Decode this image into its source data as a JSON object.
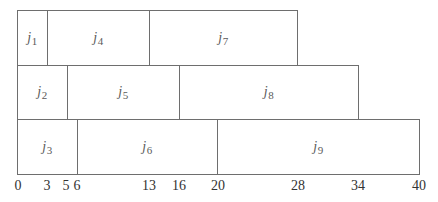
{
  "diagram": {
    "type": "gantt-schedule",
    "axis": {
      "min": 0,
      "max": 40,
      "ticks": [
        0,
        3,
        5,
        6,
        13,
        16,
        20,
        28,
        34,
        40
      ],
      "tick_labels": [
        "0",
        "3",
        "5",
        "6",
        "13",
        "16",
        "20",
        "28",
        "34",
        "40"
      ]
    },
    "rows": [
      {
        "jobs": [
          {
            "name": "j",
            "sub": "1",
            "start": 0,
            "end": 3
          },
          {
            "name": "j",
            "sub": "4",
            "start": 3,
            "end": 13
          },
          {
            "name": "j",
            "sub": "7",
            "start": 13,
            "end": 28
          }
        ]
      },
      {
        "jobs": [
          {
            "name": "j",
            "sub": "2",
            "start": 0,
            "end": 5
          },
          {
            "name": "j",
            "sub": "5",
            "start": 5,
            "end": 16
          },
          {
            "name": "j",
            "sub": "8",
            "start": 16,
            "end": 34
          }
        ]
      },
      {
        "jobs": [
          {
            "name": "j",
            "sub": "3",
            "start": 0,
            "end": 6
          },
          {
            "name": "j",
            "sub": "6",
            "start": 6,
            "end": 20
          },
          {
            "name": "j",
            "sub": "9",
            "start": 20,
            "end": 40
          }
        ]
      }
    ],
    "colors": {
      "border": "#6e6e6e",
      "fill": "#ffffff",
      "label": "#5a5a5a",
      "tick_text": "#333333"
    }
  }
}
